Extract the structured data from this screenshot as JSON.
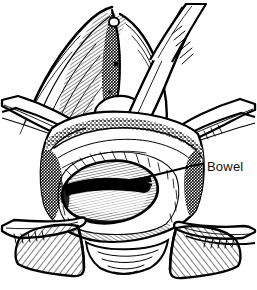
{
  "figure": {
    "type": "line-art-illustration",
    "background_color": "#ffffff",
    "ink_color": "#000000",
    "width": 257,
    "height": 290
  },
  "annotations": [
    {
      "id": "bowel",
      "label": "Bowel",
      "text_x": 207,
      "text_y": 171,
      "leader": {
        "style": "dashed-then-solid",
        "dash_x1": 190,
        "dash_y1": 166,
        "dash_x2": 203,
        "dash_y2": 164,
        "solid_x1": 110,
        "solid_y1": 186,
        "solid_x2": 188,
        "solid_y2": 167
      }
    }
  ],
  "parts": [
    {
      "name": "retractor-blade-upper-right",
      "kind": "instrument"
    },
    {
      "name": "retractor-blade-left",
      "kind": "instrument"
    },
    {
      "name": "retractor-blade-right",
      "kind": "instrument"
    },
    {
      "name": "retractor-blade-lower-left",
      "kind": "instrument"
    },
    {
      "name": "retractor-blade-lower-right",
      "kind": "instrument"
    },
    {
      "name": "abdominal-wall-tissue",
      "kind": "anatomy"
    },
    {
      "name": "bowel-loop",
      "kind": "anatomy"
    },
    {
      "name": "surgical-drape-left",
      "kind": "drape"
    },
    {
      "name": "surgical-drape-right",
      "kind": "drape"
    }
  ]
}
